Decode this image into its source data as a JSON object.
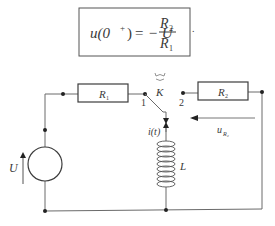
{
  "formula": {
    "lhs": "u(0",
    "sup": "+",
    "lhs_close": ")",
    "eq": "= − U",
    "numerator": "R",
    "numerator_sub": "2",
    "denominator": "R",
    "denominator_sub": "1",
    "trailing": "."
  },
  "circuit": {
    "source_label": "U",
    "r1_label": "R",
    "r1_sub": "1",
    "r2_label": "R",
    "r2_sub": "2",
    "switch_label": "K",
    "switch_pos1": "1",
    "switch_pos2": "2",
    "current_label": "i(t)",
    "inductor_label": "L",
    "voltage_label": "u",
    "voltage_sub": "R₂"
  },
  "colors": {
    "line": "#6a6a6a",
    "component": "#3c3c3c",
    "text": "#3a3a3a"
  }
}
